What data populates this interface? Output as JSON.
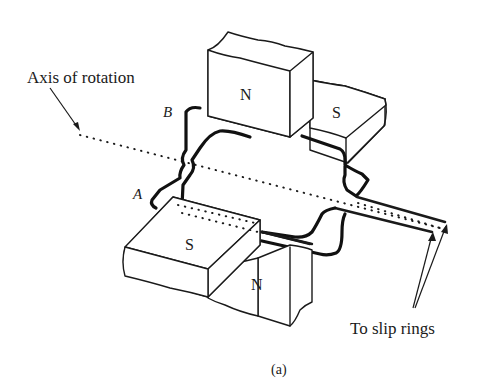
{
  "diagram": {
    "labels": {
      "axis": "Axis of rotation",
      "slip_rings": "To slip rings",
      "point_a": "A",
      "point_b": "B",
      "caption": "(a)"
    },
    "magnets": {
      "top_front": "N",
      "top_back": "S",
      "bottom_front": "S",
      "bottom_back": "N"
    },
    "colors": {
      "ink": "#1a1a1a",
      "background": "#ffffff"
    }
  }
}
